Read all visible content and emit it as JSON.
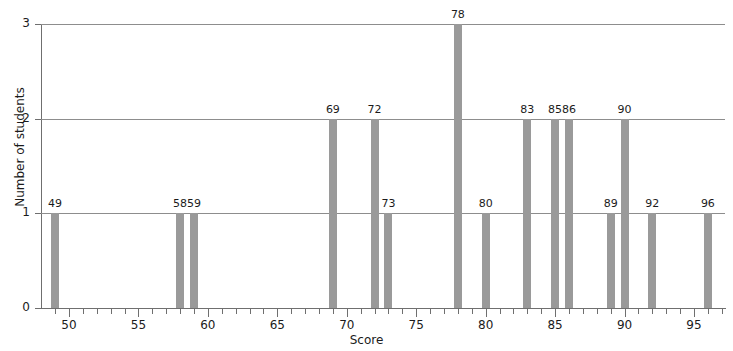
{
  "chart_data": {
    "type": "bar",
    "title": "",
    "xlabel": "Score",
    "ylabel": "Number of students",
    "categories": [
      49,
      58,
      59,
      69,
      72,
      73,
      78,
      80,
      83,
      85,
      86,
      89,
      90,
      92,
      96
    ],
    "values": [
      1,
      1,
      1,
      2,
      2,
      1,
      3,
      1,
      2,
      2,
      2,
      1,
      2,
      1,
      1
    ],
    "point_labels": [
      "49",
      "58",
      "59",
      "69",
      "72",
      "73",
      "78",
      "80",
      "83",
      "85",
      "86",
      "89",
      "90",
      "92",
      "96"
    ],
    "xlim": [
      48.5,
      97.0
    ],
    "ylim": [
      0,
      3
    ],
    "x_major_ticks": [
      50,
      55,
      60,
      65,
      70,
      75,
      80,
      85,
      90,
      95
    ],
    "x_major_tick_labels": [
      "50",
      "55",
      "60",
      "65",
      "70",
      "75",
      "80",
      "85",
      "90",
      "95"
    ],
    "x_minor_tick_step": 1,
    "y_ticks": [
      0,
      1,
      2,
      3
    ],
    "y_tick_labels": [
      "0",
      "1",
      "2",
      "3"
    ],
    "grid": "horizontal",
    "gridline_values": [
      1,
      2,
      3
    ],
    "legend": null,
    "bar_color": "#9a9a9a",
    "axis_color": "#6f6f6f",
    "gridline_color": "#8d8d8d",
    "background_color": "#ffffff",
    "text_color": "#1b1b1b"
  }
}
